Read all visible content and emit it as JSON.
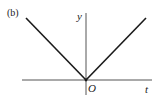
{
  "figure": {
    "panel_label": "(b)",
    "y_axis_label": "y",
    "x_axis_label": "t",
    "origin_label": "O",
    "colors": {
      "axis": "#555555",
      "curve": "#1a1a1a",
      "background": "#ffffff"
    }
  },
  "geometry": {
    "origin": [
      86,
      80
    ],
    "x_axis": {
      "x1": 22,
      "y1": 80,
      "x2": 152,
      "y2": 80
    },
    "y_axis": {
      "x1": 86,
      "y1": 13,
      "x2": 86,
      "y2": 95
    },
    "left_branch": {
      "x1": 26,
      "y1": 18,
      "x2": 86,
      "y2": 80
    },
    "right_branch": {
      "x1": 86,
      "y1": 80,
      "x2": 146,
      "y2": 18
    }
  }
}
